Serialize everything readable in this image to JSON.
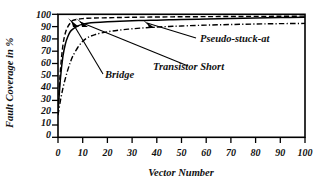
{
  "chart_data": {
    "type": "line",
    "title": "",
    "xlabel": "Vector Number",
    "ylabel": "Fault Coverage in %",
    "xlim": [
      0,
      100
    ],
    "ylim": [
      0,
      100
    ],
    "grid": false,
    "legend_position": "inline-annotations",
    "xticks": [
      "0",
      "10",
      "20",
      "30",
      "40",
      "50",
      "60",
      "70",
      "80",
      "90",
      "100"
    ],
    "yticks": [
      "0",
      "10",
      "20",
      "30",
      "40",
      "50",
      "60",
      "70",
      "80",
      "90",
      "100"
    ],
    "x": [
      0,
      1,
      2,
      3,
      4,
      5,
      6,
      8,
      10,
      12,
      15,
      20,
      25,
      30,
      35,
      40,
      45,
      50,
      60,
      70,
      80,
      90,
      100
    ],
    "series": [
      {
        "name": "Pseudo-stuck-at",
        "style": "dashed",
        "values": [
          22,
          55,
          75,
          85,
          90,
          93,
          95,
          96,
          96.5,
          96.8,
          97,
          97.2,
          97.4,
          97.6,
          97.7,
          97.8,
          97.9,
          98,
          98.1,
          98.2,
          98.3,
          98.4,
          98.5
        ]
      },
      {
        "name": "Bridge",
        "style": "solid",
        "values": [
          20,
          48,
          66,
          76,
          82,
          86,
          88,
          90.5,
          92,
          92.8,
          93.4,
          94,
          94.4,
          94.7,
          95,
          95.2,
          95.5,
          95.7,
          96.1,
          96.5,
          96.9,
          97.3,
          97.6
        ]
      },
      {
        "name": "Transistor Short",
        "style": "dash-dot",
        "values": [
          18,
          30,
          40,
          48,
          55,
          61,
          66,
          73,
          78,
          81,
          83.5,
          85.8,
          87.2,
          88.2,
          89,
          89.6,
          90.1,
          90.5,
          91.2,
          91.7,
          92.1,
          92.4,
          92.6
        ]
      }
    ],
    "annotations": [
      {
        "label": "Pseudo-stuck-at",
        "points_to_series": "Pseudo-stuck-at"
      },
      {
        "label": "Transistor Short",
        "points_to_series": "Transistor Short"
      },
      {
        "label": "Bridge",
        "points_to_series": "Bridge"
      }
    ]
  },
  "labels": {
    "ylabel": "Fault Coverage in %",
    "xlabel": "Vector Number",
    "pseudo_stuck_at": "Pseudo-stuck-at",
    "transistor_short": "Transistor Short",
    "bridge": "Bridge"
  },
  "ticks": {
    "y": [
      "100",
      "90",
      "80",
      "70",
      "60",
      "50",
      "40",
      "30",
      "20",
      "10",
      "0"
    ],
    "x": [
      "0",
      "10",
      "20",
      "30",
      "40",
      "50",
      "60",
      "70",
      "80",
      "90",
      "100"
    ]
  },
  "colors": {
    "ink": "#000000",
    "background": "#ffffff"
  }
}
